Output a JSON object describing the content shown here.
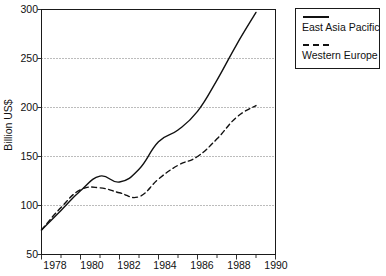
{
  "chart_data": {
    "type": "line",
    "title": "",
    "xlabel": "",
    "ylabel": "Billion US$",
    "xlim": [
      1978,
      1990
    ],
    "ylim": [
      50,
      300
    ],
    "grid": true,
    "grid_axis": "y",
    "legend_position": "right-top",
    "x": [
      1978,
      1979,
      1980,
      1981,
      1982,
      1983,
      1984,
      1985,
      1986,
      1987,
      1988,
      1989
    ],
    "xticks": [
      "1978",
      "1980",
      "1982",
      "1984",
      "1986",
      "1988",
      "1990"
    ],
    "xtick_values": [
      1978,
      1980,
      1982,
      1984,
      1986,
      1988,
      1990
    ],
    "minor_xticks_every": 1,
    "yticks": [
      "50",
      "100",
      "150",
      "200",
      "250",
      "300"
    ],
    "ytick_values": [
      50,
      100,
      150,
      200,
      250,
      300
    ],
    "series": [
      {
        "name": "East Asia Pacific",
        "style": "solid",
        "color": "#111111",
        "values": [
          75,
          95,
          115,
          130,
          124,
          137,
          165,
          177,
          196,
          228,
          264,
          297
        ]
      },
      {
        "name": "Western Europe",
        "style": "dashed",
        "color": "#111111",
        "values": [
          75,
          98,
          116,
          118,
          113,
          109,
          127,
          141,
          150,
          168,
          190,
          202
        ]
      }
    ]
  },
  "axis": {
    "y_title": "Billion US$",
    "y_tick_labels": [
      "300",
      "250",
      "200",
      "150",
      "100",
      "50"
    ],
    "x_tick_labels": [
      "1978",
      "1980",
      "1982",
      "1984",
      "1986",
      "1988",
      "1990"
    ]
  },
  "legend": {
    "entries": [
      {
        "label": "East Asia Pacific",
        "style": "solid"
      },
      {
        "label": "Western Europe",
        "style": "dashed"
      }
    ]
  }
}
